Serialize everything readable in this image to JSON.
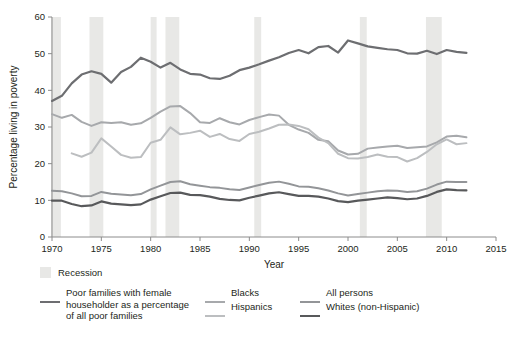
{
  "chart_data": {
    "type": "line",
    "title": "",
    "xlabel": "Year",
    "ylabel": "Percentage living in poverty",
    "xlim": [
      1970,
      2015
    ],
    "ylim": [
      0,
      60
    ],
    "xticks": [
      1970,
      1975,
      1980,
      1985,
      1990,
      1995,
      2000,
      2005,
      2010,
      2015
    ],
    "yticks": [
      0,
      10,
      20,
      30,
      40,
      50,
      60
    ],
    "grid": false,
    "legend_position": "bottom",
    "recession_label": "Recession",
    "recession_color": "#e8e8e6",
    "recession_bands": [
      {
        "start": 1969.9,
        "end": 1970.9
      },
      {
        "start": 1973.8,
        "end": 1975.2
      },
      {
        "start": 1980.0,
        "end": 1980.6
      },
      {
        "start": 1981.5,
        "end": 1982.9
      },
      {
        "start": 1990.5,
        "end": 1991.2
      },
      {
        "start": 2001.2,
        "end": 2001.9
      },
      {
        "start": 2007.9,
        "end": 2009.5
      }
    ],
    "series": [
      {
        "name": "Poor families with female householder as a percentage of all poor families",
        "legend_label": "Poor families with female\nhouseholder as a percentage\nof all poor families",
        "color": "#6d6e71",
        "width": 2.2,
        "x": [
          1970,
          1971,
          1972,
          1973,
          1974,
          1975,
          1976,
          1977,
          1978,
          1979,
          1980,
          1981,
          1982,
          1983,
          1984,
          1985,
          1986,
          1987,
          1988,
          1989,
          1990,
          1991,
          1992,
          1993,
          1994,
          1995,
          1996,
          1997,
          1998,
          1999,
          2000,
          2001,
          2002,
          2003,
          2004,
          2005,
          2006,
          2007,
          2008,
          2009,
          2010,
          2011,
          2012
        ],
        "y": [
          37.1,
          38.5,
          41.9,
          44.3,
          45.2,
          44.5,
          42.1,
          45.0,
          46.4,
          48.9,
          47.8,
          46.2,
          47.5,
          45.7,
          44.5,
          44.3,
          43.3,
          43.1,
          44.0,
          45.5,
          46.2,
          47.1,
          48.1,
          49.0,
          50.2,
          51.0,
          50.1,
          51.8,
          52.1,
          50.3,
          53.6,
          52.8,
          52.0,
          51.6,
          51.2,
          51.0,
          50.1,
          50.0,
          50.8,
          49.9,
          51.0,
          50.5,
          50.2
        ]
      },
      {
        "name": "Blacks",
        "legend_label": "Blacks",
        "color": "#a7a9ac",
        "width": 2.0,
        "x": [
          1970,
          1971,
          1972,
          1973,
          1974,
          1975,
          1976,
          1977,
          1978,
          1979,
          1980,
          1981,
          1982,
          1983,
          1984,
          1985,
          1986,
          1987,
          1988,
          1989,
          1990,
          1991,
          1992,
          1993,
          1994,
          1995,
          1996,
          1997,
          1998,
          1999,
          2000,
          2001,
          2002,
          2003,
          2004,
          2005,
          2006,
          2007,
          2008,
          2009,
          2010,
          2011,
          2012
        ],
        "y": [
          33.5,
          32.5,
          33.3,
          31.4,
          30.3,
          31.3,
          31.1,
          31.3,
          30.6,
          31.0,
          32.5,
          34.2,
          35.6,
          35.7,
          33.8,
          31.3,
          31.1,
          32.4,
          31.3,
          30.7,
          31.9,
          32.7,
          33.4,
          33.1,
          30.6,
          29.3,
          28.4,
          26.5,
          26.1,
          23.6,
          22.5,
          22.7,
          24.1,
          24.4,
          24.7,
          24.9,
          24.3,
          24.5,
          24.7,
          25.8,
          27.4,
          27.6,
          27.2
        ]
      },
      {
        "name": "Hispanics",
        "legend_label": "Hispanics",
        "color": "#bcbec0",
        "width": 2.0,
        "x": [
          1972,
          1973,
          1974,
          1975,
          1976,
          1977,
          1978,
          1979,
          1980,
          1981,
          1982,
          1983,
          1984,
          1985,
          1986,
          1987,
          1988,
          1989,
          1990,
          1991,
          1992,
          1993,
          1994,
          1995,
          1996,
          1997,
          1998,
          1999,
          2000,
          2001,
          2002,
          2003,
          2004,
          2005,
          2006,
          2007,
          2008,
          2009,
          2010,
          2011,
          2012
        ],
        "y": [
          22.8,
          21.9,
          23.0,
          26.9,
          24.7,
          22.4,
          21.6,
          21.8,
          25.7,
          26.5,
          29.9,
          28.0,
          28.4,
          29.0,
          27.3,
          28.1,
          26.7,
          26.2,
          28.1,
          28.7,
          29.6,
          30.6,
          30.7,
          30.3,
          29.4,
          27.1,
          25.6,
          22.7,
          21.5,
          21.4,
          21.8,
          22.5,
          21.9,
          21.8,
          20.6,
          21.5,
          23.2,
          25.3,
          26.6,
          25.3,
          25.6
        ]
      },
      {
        "name": "All persons",
        "legend_label": "All persons",
        "color": "#939598",
        "width": 2.0,
        "x": [
          1970,
          1971,
          1972,
          1973,
          1974,
          1975,
          1976,
          1977,
          1978,
          1979,
          1980,
          1981,
          1982,
          1983,
          1984,
          1985,
          1986,
          1987,
          1988,
          1989,
          1990,
          1991,
          1992,
          1993,
          1994,
          1995,
          1996,
          1997,
          1998,
          1999,
          2000,
          2001,
          2002,
          2003,
          2004,
          2005,
          2006,
          2007,
          2008,
          2009,
          2010,
          2011,
          2012
        ],
        "y": [
          12.6,
          12.5,
          11.9,
          11.1,
          11.2,
          12.3,
          11.8,
          11.6,
          11.4,
          11.7,
          13.0,
          14.0,
          15.0,
          15.2,
          14.4,
          14.0,
          13.6,
          13.4,
          13.0,
          12.8,
          13.5,
          14.2,
          14.8,
          15.1,
          14.5,
          13.8,
          13.7,
          13.3,
          12.7,
          11.9,
          11.3,
          11.7,
          12.1,
          12.5,
          12.7,
          12.6,
          12.3,
          12.5,
          13.2,
          14.3,
          15.1,
          15.0,
          15.0
        ]
      },
      {
        "name": "Whites (non-Hispanic)",
        "legend_label": "Whites (non-Hispanic)",
        "color": "#58595b",
        "width": 2.2,
        "x": [
          1970,
          1971,
          1972,
          1973,
          1974,
          1975,
          1976,
          1977,
          1978,
          1979,
          1980,
          1981,
          1982,
          1983,
          1984,
          1985,
          1986,
          1987,
          1988,
          1989,
          1990,
          1991,
          1992,
          1993,
          1994,
          1995,
          1996,
          1997,
          1998,
          1999,
          2000,
          2001,
          2002,
          2003,
          2004,
          2005,
          2006,
          2007,
          2008,
          2009,
          2010,
          2011,
          2012
        ],
        "y": [
          9.9,
          9.9,
          9.0,
          8.4,
          8.6,
          9.7,
          9.1,
          8.9,
          8.7,
          8.9,
          10.2,
          11.1,
          12.0,
          12.1,
          11.5,
          11.4,
          11.0,
          10.4,
          10.1,
          10.0,
          10.7,
          11.3,
          11.9,
          12.2,
          11.7,
          11.2,
          11.2,
          11.0,
          10.5,
          9.8,
          9.5,
          9.9,
          10.2,
          10.5,
          10.8,
          10.6,
          10.3,
          10.5,
          11.2,
          12.3,
          13.0,
          12.8,
          12.7
        ]
      }
    ]
  },
  "axes": {
    "y_title": "Percentage living in poverty",
    "x_title": "Year",
    "y_ticks": [
      "0",
      "10",
      "20",
      "30",
      "40",
      "50",
      "60"
    ],
    "x_ticks": [
      "1970",
      "1975",
      "1980",
      "1985",
      "1990",
      "1995",
      "2000",
      "2005",
      "2010",
      "2015"
    ]
  },
  "legend": {
    "recession": "Recession",
    "entries": [
      {
        "label_lines": [
          "Poor families with female",
          "householder as a percentage",
          "of all poor families"
        ],
        "color": "#6d6e71"
      },
      {
        "label_lines": [
          "Blacks"
        ],
        "color": "#a7a9ac"
      },
      {
        "label_lines": [
          "Hispanics"
        ],
        "color": "#bcbec0"
      },
      {
        "label_lines": [
          "All persons"
        ],
        "color": "#939598"
      },
      {
        "label_lines": [
          "Whites (non-Hispanic)"
        ],
        "color": "#58595b"
      }
    ]
  }
}
